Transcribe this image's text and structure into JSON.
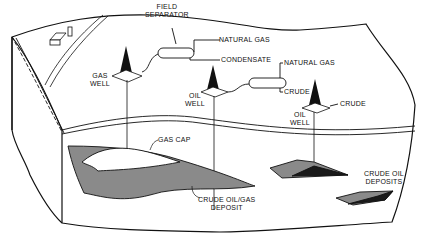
{
  "diagram": {
    "colors": {
      "line": "#111111",
      "deposit": "#8a8a8a",
      "deposit_dark": "#1a1a1a",
      "background": "#ffffff"
    },
    "labels": {
      "field_separator_1": "FIELD",
      "field_separator_2": "SEPARATOR",
      "natural_gas_top": "NATURAL GAS",
      "condensate": "CONDENSATE",
      "natural_gas_right": "NATURAL GAS",
      "crude_separator": "CRUDE",
      "crude_right": "CRUDE",
      "gas_well_1": "GAS",
      "gas_well_2": "WELL",
      "oil_well_mid_1": "OIL",
      "oil_well_mid_2": "WELL",
      "oil_well_right_1": "OIL",
      "oil_well_right_2": "WELL",
      "gas_cap": "GAS CAP",
      "crude_oil_gas_1": "CRUDE OIL/GAS",
      "crude_oil_gas_2": "DEPOSIT",
      "crude_oil_deposits_1": "CRUDE OIL",
      "crude_oil_deposits_2": "DEPOSITS"
    },
    "icons": [
      "farm-barn-icon",
      "derrick-icon",
      "separator-tank-icon"
    ]
  }
}
